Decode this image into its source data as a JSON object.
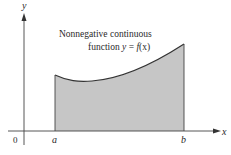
{
  "diagram": {
    "caption_line1": "Nonnegative continuous",
    "caption_line2_prefix": "function ",
    "caption_line2_y": "y",
    "caption_line2_eq": " = ",
    "caption_line2_f": "f",
    "caption_line2_arg": "(x)",
    "axis_x_label": "x",
    "axis_y_label": "y",
    "origin_label": "0",
    "left_bound_label": "a",
    "right_bound_label": "b",
    "colors": {
      "fill": "#c6c6c6",
      "line": "#333333",
      "axis": "#444444"
    }
  }
}
